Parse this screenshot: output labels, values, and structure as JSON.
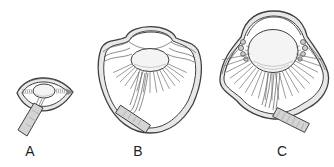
{
  "figure": {
    "panels": [
      {
        "label": "A"
      },
      {
        "label": "B"
      },
      {
        "label": "C"
      }
    ],
    "colors": {
      "background": "#ffffff",
      "outline": "#3f3f3f",
      "wall-fill": "#e8e8e8",
      "lens-fill": "#f4f4f4",
      "nerve-fill": "#d4d4d4",
      "fiber-stroke": "#6f6f6f",
      "label-color": "#1f1f1f"
    }
  }
}
